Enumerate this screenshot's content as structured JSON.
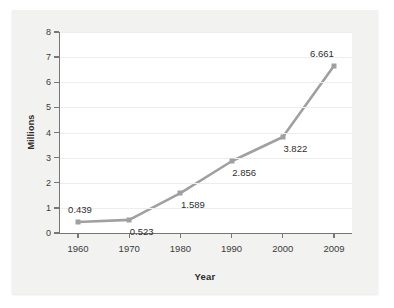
{
  "chart_data": {
    "type": "line",
    "title": "",
    "xlabel": "Year",
    "ylabel": "Millions",
    "categories": [
      "1960",
      "1970",
      "1980",
      "1990",
      "2000",
      "2009"
    ],
    "values": [
      0.439,
      0.523,
      1.589,
      2.856,
      3.822,
      6.661
    ],
    "point_labels": [
      "0.439",
      "0.523",
      "1.589",
      "2.856",
      "3.822",
      "6.661"
    ],
    "label_positions": [
      "above-right",
      "below-right",
      "below-right",
      "below-right",
      "below-right",
      "above-left"
    ],
    "ylim": [
      0,
      8
    ],
    "yticks": [
      "0",
      "1",
      "2",
      "3",
      "4",
      "5",
      "6",
      "7",
      "8"
    ],
    "ytick_values": [
      0,
      1,
      2,
      3,
      4,
      5,
      6,
      7,
      8
    ],
    "xticks": [
      "1960",
      "1970",
      "1980",
      "1990",
      "2000",
      "2009"
    ],
    "grid": "horizontal",
    "legend": "none",
    "series_color": "#a0a0a0",
    "grid_color": "#ededed",
    "axis_color": "#777777",
    "background_color": "#f2f2f0",
    "plot_background_color": "#ffffff"
  }
}
